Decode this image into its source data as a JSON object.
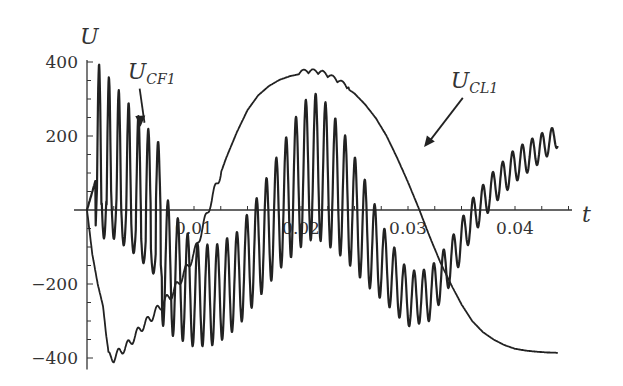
{
  "chart_data": {
    "type": "line",
    "title": "",
    "xlabel": "t",
    "ylabel": "U",
    "xlim": [
      0,
      0.044
    ],
    "ylim": [
      -420,
      400
    ],
    "x_ticks": [
      0.01,
      0.02,
      0.03,
      0.04
    ],
    "x_tick_labels": [
      "0.01",
      "0.02",
      "0.03",
      "0.04"
    ],
    "y_ticks": [
      -400,
      -200,
      200,
      400
    ],
    "y_tick_labels": [
      "−400",
      "−200",
      "200",
      "400"
    ],
    "y_minor_step": 50,
    "x_minor_step": 0.0025,
    "grid": false,
    "legend": "none (inline arrow annotations)",
    "annotations": [
      {
        "text": "U",
        "sub": "CF1",
        "series": "U_CF1",
        "label_x": 0.0038,
        "label_y": 355,
        "arrow_to": [
          0.005,
          225
        ]
      },
      {
        "text": "U",
        "sub": "CL1",
        "series": "U_CL1",
        "label_x": 0.034,
        "label_y": 330,
        "arrow_to": [
          0.0315,
          170
        ]
      }
    ],
    "series": [
      {
        "name": "U_CL1",
        "description": "Capacitor CL1 voltage: starts at 0, dips to about -400 at t~0.002, rises to a rippled peak of about 360-370 near t~0.02-0.023, crosses zero near t~0.031, falls to about -385 at t~0.044",
        "x": [
          0,
          0.0005,
          0.001,
          0.0015,
          0.002,
          0.0025,
          0.003,
          0.004,
          0.005,
          0.006,
          0.007,
          0.008,
          0.009,
          0.01,
          0.011,
          0.012,
          0.013,
          0.014,
          0.015,
          0.016,
          0.017,
          0.018,
          0.019,
          0.02,
          0.021,
          0.022,
          0.023,
          0.024,
          0.025,
          0.026,
          0.027,
          0.028,
          0.029,
          0.03,
          0.031,
          0.032,
          0.033,
          0.034,
          0.035,
          0.036,
          0.037,
          0.038,
          0.039,
          0.04,
          0.041,
          0.042,
          0.043,
          0.044
        ],
        "y": [
          0,
          -120,
          -200,
          -260,
          -395,
          -400,
          -385,
          -360,
          -320,
          -290,
          -255,
          -225,
          -175,
          -120,
          -30,
          60,
          140,
          210,
          270,
          310,
          335,
          352,
          362,
          368,
          370,
          366,
          352,
          335,
          315,
          285,
          248,
          200,
          140,
          75,
          5,
          -70,
          -140,
          -200,
          -255,
          -300,
          -330,
          -350,
          -365,
          -375,
          -380,
          -383,
          -385,
          -386
        ],
        "ripple_amplitude": 12,
        "ripple_period": 0.0009
      },
      {
        "name": "U_CF1",
        "description": "Filter capacitor CF1 voltage: high-frequency oscillation (~0.0009 s period) around a slower sinusoidal envelope; early spikes up to ~380 decaying; centre swings down to about -230 near t~0.01, up to about +120 near t~0.021, down to about -240 near t~0.03, rising to ~+200 at t~0.044",
        "x": [
          0,
          0.002,
          0.004,
          0.006,
          0.008,
          0.01,
          0.012,
          0.014,
          0.016,
          0.018,
          0.02,
          0.021,
          0.022,
          0.024,
          0.026,
          0.028,
          0.03,
          0.032,
          0.034,
          0.036,
          0.038,
          0.04,
          0.042,
          0.044
        ],
        "center": [
          40,
          60,
          0,
          -80,
          -170,
          -230,
          -230,
          -190,
          -100,
          0,
          90,
          120,
          110,
          40,
          -60,
          -160,
          -240,
          -230,
          -140,
          -20,
          60,
          120,
          160,
          200
        ],
        "amplitude": [
          0,
          300,
          260,
          200,
          170,
          140,
          135,
          130,
          140,
          160,
          190,
          200,
          195,
          170,
          140,
          95,
          75,
          70,
          60,
          50,
          45,
          45,
          40,
          30
        ],
        "oscillation_period": 0.00092
      }
    ]
  }
}
